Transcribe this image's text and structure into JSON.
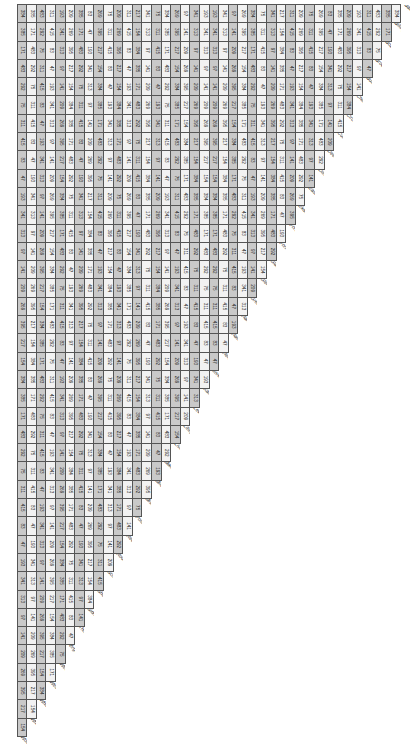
{
  "document": {
    "type": "mileage-chart",
    "orientation": "rotated-90",
    "cities": [
      "Baker",
      "Billings",
      "Bozeman",
      "Broadus",
      "Butte",
      "Chinook",
      "Circle",
      "Cut Bank",
      "Deer Lodge",
      "Dillon",
      "East Glacier Park",
      "Ekalaka",
      "Forsyth",
      "Fort Benton",
      "Glasgow",
      "Glendive",
      "Great Falls",
      "Hamilton",
      "Havre",
      "Helena",
      "Jordan",
      "Kalispell",
      "Lewistown",
      "Libby",
      "Livingston",
      "Malta",
      "Miles City",
      "Missoula",
      "Polson",
      "Red Lodge",
      "Roundup",
      "Scobey",
      "Shelby",
      "Sidney",
      "Thompson Falls",
      "Virginia City",
      "West Glacier",
      "West Yellowstone",
      "Whitefish",
      "White Sulphur Springs",
      "Wolf Point"
    ],
    "sample_values": {
      "top_right_corner": [
        "384",
        "385",
        "171",
        "483",
        "292",
        "75",
        "311",
        "415"
      ],
      "bottom_left_corner": [
        "83",
        "47",
        "193",
        "341",
        "313",
        "97",
        "141",
        "209",
        "269",
        "395",
        "217",
        "154"
      ]
    },
    "colors": {
      "row_dark": "#c9c9c9",
      "row_light": "#f2f2f2",
      "grid": "#555555",
      "text": "#222222"
    }
  }
}
